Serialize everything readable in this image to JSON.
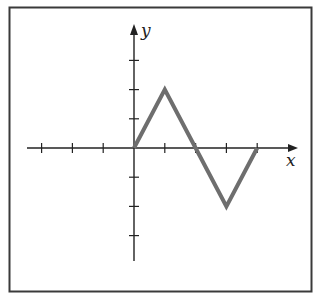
{
  "chart_data": {
    "type": "line",
    "title": "",
    "xlabel": "x",
    "ylabel": "y",
    "x": [
      0,
      1,
      2,
      3,
      4
    ],
    "values": [
      0,
      2,
      0,
      -2,
      0
    ],
    "series": [
      {
        "name": "f(x)",
        "x": [
          0,
          1,
          2,
          3,
          4
        ],
        "values": [
          0,
          2,
          0,
          -2,
          0
        ]
      }
    ],
    "xlim": [
      -4.5,
      5.3
    ],
    "ylim": [
      -3.8,
      4.2
    ],
    "x_ticks": [
      -3,
      -2,
      -1,
      1,
      2,
      3,
      4
    ],
    "y_ticks": [
      -3,
      -2,
      -1,
      1,
      2,
      3
    ],
    "grid": false,
    "line_color": "#6e6e6e",
    "axis_color": "#222222"
  },
  "labels": {
    "x_axis": "x",
    "y_axis": "y"
  }
}
